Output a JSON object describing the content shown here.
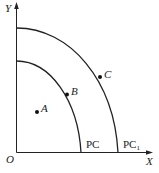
{
  "diagram": {
    "type": "production-possibility-frontier",
    "axes": {
      "x_label": "X",
      "y_label": "Y",
      "origin_label": "O"
    },
    "curves": [
      {
        "name": "PC",
        "label": "PC"
      },
      {
        "name": "PC1",
        "label": "PC",
        "subscript": "1"
      }
    ],
    "points": [
      {
        "name": "A",
        "label": "A"
      },
      {
        "name": "B",
        "label": "B"
      },
      {
        "name": "C",
        "label": "C"
      }
    ],
    "colors": {
      "line": "#222222",
      "background": "#ffffff"
    }
  }
}
